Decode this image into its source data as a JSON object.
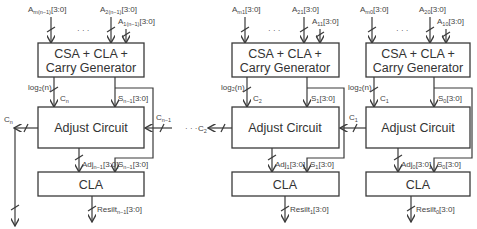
{
  "diagram": {
    "colors": {
      "stroke": "#3a3a3a",
      "text": "#333333",
      "background": "#ffffff"
    },
    "ellipsis": "· · ·",
    "blocks": [
      {
        "index": "n-1",
        "inputs": [
          {
            "base": "A",
            "sub": "m(n−1)",
            "bits": "[3:0]"
          },
          {
            "base": "A",
            "sub": "2(n−1)",
            "bits": "[3:0]"
          },
          {
            "base": "A",
            "sub": "1(n−1)",
            "bits": "[3:0]"
          }
        ],
        "csa_label_line1": "CSA + CLA +",
        "csa_label_line2": "Carry Generator",
        "log_label": "log₂(n)",
        "carry_in_label": {
          "base": "C",
          "sub": "n"
        },
        "sum_label": {
          "base": "S",
          "sub": "n−1",
          "bits": "[3:0]"
        },
        "adjust_label": "Adjust Circuit",
        "carry_out_label": {
          "base": "C",
          "sub": "n"
        },
        "carry_right_label": {
          "base": "C",
          "sub": "n−1"
        },
        "adj_label": {
          "base": "Adj",
          "sub": "n−1",
          "bits": "[3:0]"
        },
        "sum2_label": {
          "base": "S",
          "sub": "n−1",
          "bits": "[3:0]"
        },
        "cla_label": "CLA",
        "result_label": {
          "base": "Resilt",
          "sub": "n−1",
          "bits": "[3:0]"
        }
      },
      {
        "index": "1",
        "inputs": [
          {
            "base": "A",
            "sub": "m1",
            "bits": "[3:0]"
          },
          {
            "base": "A",
            "sub": "21",
            "bits": "[3:0]"
          },
          {
            "base": "A",
            "sub": "11",
            "bits": "[3:0]"
          }
        ],
        "csa_label_line1": "CSA + CLA +",
        "csa_label_line2": "Carry Generator",
        "log_label": "log₂(n)",
        "carry_in_label": {
          "base": "C",
          "sub": "2"
        },
        "sum_label": {
          "base": "S",
          "sub": "1",
          "bits": "[3:0]"
        },
        "adjust_label": "Adjust Circuit",
        "carry_out_label": {
          "base": "C",
          "sub": "2"
        },
        "carry_right_label": {
          "base": "C",
          "sub": "1"
        },
        "adj_label": {
          "base": "Adj",
          "sub": "1",
          "bits": "[3:0]"
        },
        "sum2_label": {
          "base": "S",
          "sub": "1",
          "bits": "[3:0]"
        },
        "cla_label": "CLA",
        "result_label": {
          "base": "Resilt",
          "sub": "1",
          "bits": "[3:0]"
        }
      },
      {
        "index": "0",
        "inputs": [
          {
            "base": "A",
            "sub": "m0",
            "bits": "[3:0]"
          },
          {
            "base": "A",
            "sub": "20",
            "bits": "[3:0]"
          },
          {
            "base": "A",
            "sub": "10",
            "bits": "[3:0]"
          }
        ],
        "csa_label_line1": "CSA + CLA +",
        "csa_label_line2": "Carry Generator",
        "log_label": "log₂(n)",
        "carry_in_label": {
          "base": "C",
          "sub": "1"
        },
        "sum_label": {
          "base": "S",
          "sub": "0",
          "bits": "[3:0]"
        },
        "adjust_label": "Adjust Circuit",
        "adj_label": {
          "base": "Adj",
          "sub": "0",
          "bits": "[3:0]"
        },
        "sum2_label": {
          "base": "S",
          "sub": "0",
          "bits": "[3:0]"
        },
        "cla_label": "CLA",
        "result_label": {
          "base": "Resilt",
          "sub": "0",
          "bits": "[3:0]"
        }
      }
    ]
  }
}
